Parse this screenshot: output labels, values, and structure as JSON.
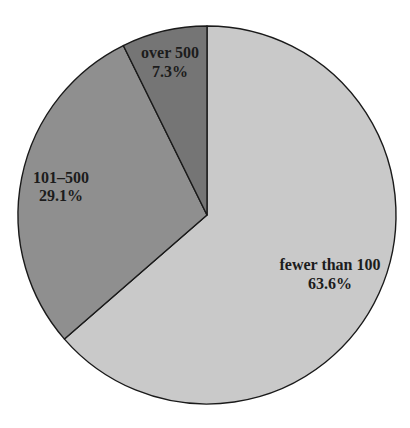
{
  "chart_data": {
    "type": "pie",
    "title": "",
    "start_angle_deg": 0,
    "direction": "clockwise",
    "categories": [
      "fewer than 100",
      "101–500",
      "over 500"
    ],
    "values": [
      63.6,
      29.1,
      7.3
    ],
    "value_labels": [
      "63.6%",
      "29.1%",
      "7.3%"
    ],
    "colors": [
      "#c9c9c9",
      "#8f8f8f",
      "#757575"
    ],
    "legend": "none (labels inside slices)"
  },
  "geometry": {
    "cx": 207,
    "cy": 215,
    "r": 189
  },
  "labels": [
    {
      "name": "fewer than 100",
      "pct": "63.6%",
      "x": 330,
      "y1": 270,
      "y2": 289
    },
    {
      "name": "101–500",
      "pct": "29.1%",
      "x": 61,
      "y1": 183,
      "y2": 201
    },
    {
      "name": "over 500",
      "pct": "7.3%",
      "x": 170,
      "y1": 58,
      "y2": 77
    }
  ]
}
